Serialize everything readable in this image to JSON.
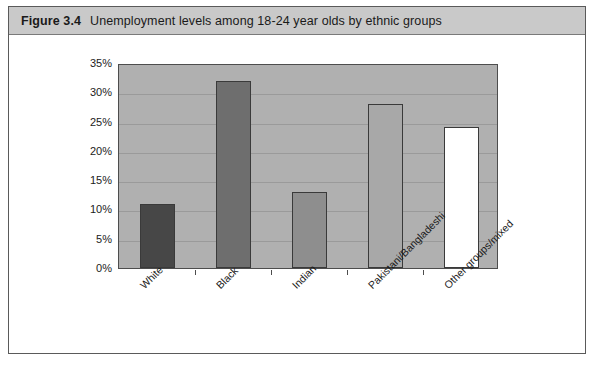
{
  "figure": {
    "number": "Figure 3.4",
    "caption": "Unemployment levels among 18-24 year olds by ethnic groups"
  },
  "chart_data": {
    "type": "bar",
    "title": "Unemployment levels among 18-24 year olds by ethnic groups",
    "xlabel": "",
    "ylabel": "",
    "categories": [
      "White",
      "Black",
      "Indian",
      "Pakistani/Bangladeshi",
      "Other groups/mixed"
    ],
    "values": [
      11,
      32,
      13,
      28,
      24
    ],
    "value_unit": "%",
    "ylim": [
      0,
      35
    ],
    "ytick_labels": [
      "0%",
      "5%",
      "10%",
      "15%",
      "20%",
      "25%",
      "30%",
      "35%"
    ],
    "ytick_values": [
      0,
      5,
      10,
      15,
      20,
      25,
      30,
      35
    ],
    "grid": true,
    "legend": "none",
    "bar_colors": [
      "#474747",
      "#6e6e6e",
      "#8e8e8e",
      "#a8a8a8",
      "#ffffff"
    ],
    "plot_background": "#b0b0b0",
    "axis_color": "#4d4d4d",
    "gridline_color": "#9a9a9a"
  }
}
